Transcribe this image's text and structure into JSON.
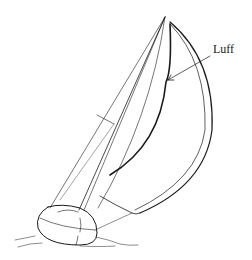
{
  "diagram": {
    "labels": [
      {
        "text": "Luff",
        "target": "spinnaker luff edge"
      }
    ],
    "colors": {
      "line": "#1a1a1a",
      "background": "#ffffff"
    }
  }
}
